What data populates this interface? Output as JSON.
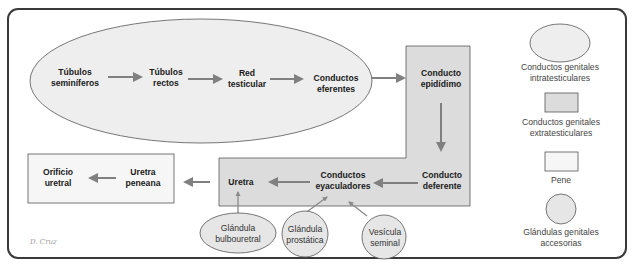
{
  "colors": {
    "frame": "#3a3a3a",
    "intratesticular_fill": "#eeeeee",
    "extratesticular_fill": "#dcdcdc",
    "pene_fill": "#f6f6f6",
    "gland_fill": "#e6e6e6",
    "arrow": "#808080",
    "outline": "#555555"
  },
  "nodes": {
    "tubulos_seminiferos": [
      "Túbulos",
      "seminíferos"
    ],
    "tubulos_rectos": [
      "Túbulos",
      "rectos"
    ],
    "red_testicular": [
      "Red",
      "testicular"
    ],
    "conductos_eferentes": [
      "Conductos",
      "eferentes"
    ],
    "conducto_epididimo": [
      "Conducto",
      "epidídimo"
    ],
    "conducto_deferente": [
      "Conducto",
      "deferente"
    ],
    "conductos_eyaculadores": [
      "Conductos",
      "eyaculadores"
    ],
    "uretra": [
      "Uretra"
    ],
    "uretra_peneana": [
      "Uretra",
      "peneana"
    ],
    "orificio_uretral": [
      "Orificio",
      "uretral"
    ]
  },
  "glands": {
    "bulbouretral": [
      "Glándula",
      "bulbouretral"
    ],
    "prostatica": [
      "Glándula",
      "prostática"
    ],
    "vesicula_seminal": [
      "Vesícula",
      "seminal"
    ]
  },
  "legend": [
    {
      "shape": "ellipse",
      "label": [
        "Conductos genitales",
        "intratesticulares"
      ]
    },
    {
      "shape": "rect-dark",
      "label": [
        "Conductos genitales",
        "extratesticulares"
      ]
    },
    {
      "shape": "rect-light",
      "label": [
        "Pene"
      ]
    },
    {
      "shape": "circle",
      "label": [
        "Glándulas genitales",
        "accesorias"
      ]
    }
  ],
  "signature": "D. Cruz"
}
